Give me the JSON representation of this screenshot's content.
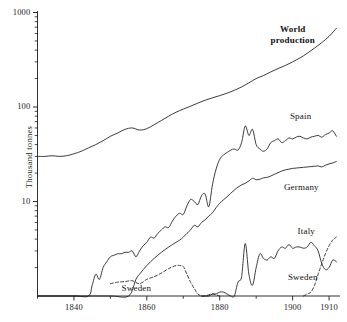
{
  "figure": {
    "background": "#ffffff",
    "ink_color": "#1a1a1a",
    "width": 347,
    "height": 322
  },
  "axes": {
    "y_label": "Thousand  tonnes",
    "y_scale": "log",
    "y_ticks_major": [
      "10",
      "100",
      "1000"
    ],
    "x_ticks_major": [
      "1840",
      "1860",
      "1880",
      "1900",
      "1910"
    ]
  },
  "labels": {
    "world_line1": "World",
    "world_line2": "production",
    "spain": "Spain",
    "germany": "Germany",
    "italy": "Italy",
    "sweden_right": "Sweden",
    "sweden_left": "Sweden"
  },
  "chart_data": {
    "type": "line",
    "title": "",
    "subtitle": "",
    "xlabel": "",
    "ylabel": "Thousand tonnes",
    "xlim": [
      1830,
      1913
    ],
    "ylim": [
      1,
      1300
    ],
    "yscale": "log",
    "xscale": "linear",
    "grid": false,
    "legend_position": "inline-annotations",
    "y_ticks_major": [
      10,
      100,
      1000
    ],
    "y_ticks_minor": [
      2,
      3,
      4,
      5,
      6,
      7,
      8,
      9,
      20,
      30,
      40,
      50,
      60,
      70,
      80,
      90,
      200,
      300,
      400,
      500,
      600,
      700,
      800,
      900
    ],
    "x_ticks_major": [
      1840,
      1860,
      1880,
      1900,
      1910
    ],
    "x_ticks_minor": [
      1830,
      1850,
      1870,
      1890
    ],
    "units": "thousand tonnes",
    "annotations": [
      {
        "text": "World production",
        "x": 1900,
        "y": 560,
        "bold": true
      },
      {
        "text": "Spain",
        "x": 1902,
        "y": 62
      },
      {
        "text": "Germany",
        "x": 1902,
        "y": 17
      },
      {
        "text": "Italy",
        "x": 1903,
        "y": 3.9
      },
      {
        "text": "Sweden",
        "x": 1902,
        "y": 2.0
      },
      {
        "text": "Sweden",
        "x": 1858,
        "y": 1.45
      }
    ],
    "series": [
      {
        "name": "World production",
        "style": "solid",
        "x": [
          1830,
          1832,
          1834,
          1836,
          1838,
          1840,
          1842,
          1844,
          1846,
          1848,
          1850,
          1852,
          1854,
          1856,
          1858,
          1860,
          1862,
          1864,
          1866,
          1868,
          1870,
          1872,
          1874,
          1876,
          1878,
          1880,
          1882,
          1884,
          1886,
          1888,
          1890,
          1892,
          1894,
          1896,
          1898,
          1900,
          1902,
          1904,
          1906,
          1908,
          1910,
          1912
        ],
        "y": [
          30,
          30,
          30.5,
          30,
          30.5,
          32,
          34,
          37,
          40,
          44,
          49,
          53,
          58,
          60,
          57,
          59,
          65,
          72,
          80,
          88,
          95,
          102,
          110,
          118,
          125,
          132,
          140,
          150,
          163,
          180,
          200,
          215,
          235,
          255,
          275,
          300,
          330,
          370,
          420,
          480,
          560,
          680
        ]
      },
      {
        "name": "Spain",
        "style": "solid",
        "x": [
          1830,
          1840,
          1844,
          1845,
          1846,
          1847,
          1848,
          1849,
          1850,
          1851,
          1852,
          1853,
          1854,
          1855,
          1856,
          1857,
          1858,
          1859,
          1860,
          1861,
          1862,
          1863,
          1864,
          1865,
          1866,
          1867,
          1868,
          1869,
          1870,
          1871,
          1872,
          1873,
          1874,
          1875,
          1876,
          1877,
          1878,
          1879,
          1880,
          1881,
          1882,
          1883,
          1884,
          1885,
          1886,
          1887,
          1888,
          1889,
          1890,
          1891,
          1892,
          1893,
          1894,
          1895,
          1896,
          1897,
          1898,
          1899,
          1900,
          1901,
          1902,
          1903,
          1904,
          1905,
          1906,
          1907,
          1908,
          1909,
          1910,
          1911,
          1912
        ],
        "y": [
          1,
          1,
          1,
          1.3,
          1.7,
          1.5,
          2.0,
          2.3,
          2.6,
          2.7,
          2.8,
          2.8,
          2.9,
          2.9,
          3.0,
          2.6,
          3.0,
          3.4,
          3.7,
          4.2,
          4.1,
          4.6,
          5.0,
          5.4,
          5.3,
          6.2,
          7.0,
          7.5,
          7.3,
          9.0,
          10.5,
          10.0,
          9.3,
          11.5,
          12.0,
          8.8,
          15,
          22,
          28,
          31,
          33,
          35,
          36,
          35,
          42,
          63,
          50,
          58,
          40,
          36,
          34,
          36,
          42,
          44,
          46,
          42,
          44,
          47,
          46,
          48,
          49,
          47,
          46,
          48,
          49,
          50,
          48,
          51,
          53,
          56,
          49
        ]
      },
      {
        "name": "Germany",
        "style": "solid",
        "x": [
          1830,
          1840,
          1850,
          1855,
          1857,
          1858,
          1859,
          1860,
          1861,
          1862,
          1863,
          1864,
          1865,
          1866,
          1867,
          1868,
          1869,
          1870,
          1871,
          1872,
          1873,
          1874,
          1875,
          1876,
          1877,
          1878,
          1879,
          1880,
          1881,
          1882,
          1883,
          1884,
          1885,
          1886,
          1887,
          1888,
          1889,
          1890,
          1891,
          1892,
          1893,
          1894,
          1895,
          1896,
          1897,
          1898,
          1899,
          1900,
          1901,
          1902,
          1903,
          1904,
          1905,
          1906,
          1907,
          1908,
          1909,
          1910,
          1911,
          1912
        ],
        "y": [
          1,
          1,
          1,
          1,
          1.5,
          1.7,
          1.9,
          2.1,
          2.3,
          2.5,
          2.7,
          2.9,
          3.1,
          3.3,
          3.5,
          3.7,
          3.9,
          4.2,
          4.6,
          5.0,
          5.6,
          5.4,
          6.0,
          6.4,
          7.0,
          7.6,
          8.6,
          9.6,
          10.4,
          11.2,
          12.2,
          13.2,
          14.2,
          15.0,
          15.6,
          16.5,
          17.6,
          17.0,
          17.2,
          17.8,
          18.0,
          18.6,
          19.4,
          20.2,
          21.0,
          21.6,
          22.0,
          22.4,
          22.6,
          22.8,
          23.0,
          23.2,
          23.4,
          23.6,
          23.8,
          23.2,
          24.2,
          25.0,
          25.6,
          26.5
        ]
      },
      {
        "name": "Italy",
        "style": "solid",
        "x": [
          1875,
          1876,
          1877,
          1878,
          1879,
          1880,
          1881,
          1882,
          1883,
          1884,
          1885,
          1886,
          1887,
          1888,
          1889,
          1890,
          1891,
          1892,
          1893,
          1894,
          1895,
          1896,
          1897,
          1898,
          1899,
          1900,
          1901,
          1902,
          1903,
          1904,
          1905,
          1906,
          1907,
          1908,
          1909,
          1910,
          1911,
          1912
        ],
        "y": [
          1,
          1,
          1,
          1.05,
          1.05,
          1.1,
          1.1,
          1.05,
          1.0,
          1.0,
          1.4,
          1.6,
          3.6,
          1.7,
          1.3,
          2.0,
          2.8,
          2.5,
          2.4,
          2.6,
          2.5,
          3.0,
          3.3,
          3.2,
          3.5,
          3.2,
          3.3,
          3.3,
          3.2,
          3.3,
          3.7,
          3.4,
          3.0,
          2.2,
          1.9,
          2.0,
          2.4,
          2.3
        ]
      },
      {
        "name": "Sweden (early)",
        "style": "dashed",
        "x": [
          1850,
          1852,
          1854,
          1856,
          1858,
          1860,
          1862,
          1864,
          1866,
          1868,
          1869,
          1870,
          1871,
          1872,
          1873,
          1874,
          1875,
          1876,
          1878,
          1880
        ],
        "y": [
          1.35,
          1.4,
          1.42,
          1.45,
          1.35,
          1.5,
          1.6,
          1.75,
          1.95,
          2.1,
          2.1,
          2.05,
          1.7,
          1.4,
          1.2,
          1.05,
          1.0,
          1.0,
          1.05,
          1.0
        ]
      },
      {
        "name": "Sweden (late)",
        "style": "dashed",
        "x": [
          1903,
          1904,
          1905,
          1906,
          1907,
          1908,
          1909,
          1910,
          1911,
          1912
        ],
        "y": [
          1.0,
          1.05,
          1.1,
          1.3,
          1.7,
          2.2,
          2.8,
          3.4,
          3.9,
          4.2
        ]
      }
    ]
  }
}
